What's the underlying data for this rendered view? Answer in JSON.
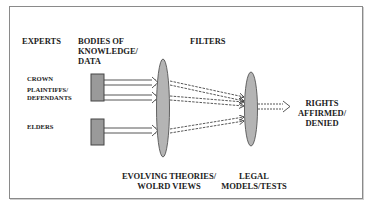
{
  "diagram": {
    "headers": {
      "experts": "EXPERTS",
      "bodies_of_knowledge_line1": "BODIES OF",
      "bodies_of_knowledge_line2": "KNOWLEDGE/",
      "bodies_of_knowledge_line3": "DATA",
      "filters": "FILTERS"
    },
    "experts": [
      {
        "label": "CROWN"
      },
      {
        "label_line1": "PLAINTIFFS/",
        "label_line2": "DEFENDANTS"
      },
      {
        "label": "ELDERS"
      }
    ],
    "filters": {
      "first": {
        "line1": "EVOLVING THEORIES/",
        "line2": "WOLRD VIEWS"
      },
      "second": {
        "line1": "LEGAL",
        "line2": "MODELS/TESTS"
      }
    },
    "outcome": {
      "line1": "RIGHTS",
      "line2": "AFFIRMED/",
      "line3": "DENIED"
    },
    "colors": {
      "box_fill": "#9a9a9a",
      "ellipse_fill": "#b4b4b4",
      "stroke": "#444444"
    }
  }
}
